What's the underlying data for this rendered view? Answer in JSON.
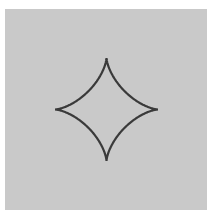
{
  "header": {
    "cut_off_text": ""
  },
  "figure": {
    "shape": "astroid",
    "center": [
      106.5,
      109.5
    ],
    "radius": 51.5,
    "cusps": [
      {
        "name": "top",
        "x": 106.5,
        "y": 58
      },
      {
        "name": "right",
        "x": 158,
        "y": 109.5
      },
      {
        "name": "bottom",
        "x": 106.5,
        "y": 161
      },
      {
        "name": "left",
        "x": 55,
        "y": 109.5
      }
    ],
    "colors": {
      "panel_background": "#c9c9c9",
      "stroke": "#3a3a3a",
      "page_background": "#ffffff"
    }
  }
}
